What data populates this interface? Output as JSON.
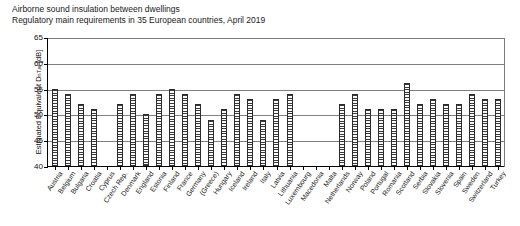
{
  "chart_data": {
    "type": "bar",
    "title": "Airborne sound insulation between dwellings",
    "subtitle": "Regulatory main requirements in 35 European countries, April 2019",
    "xlabel": "",
    "ylabel": "Estimated Equivalent D",
    "ylabel_sub": "nT,w",
    "ylabel_unit": " [dB]",
    "ylim": [
      40,
      65
    ],
    "yticks": [
      40,
      45,
      50,
      55,
      60,
      65
    ],
    "grid": true,
    "legend": "none",
    "categories": [
      "Austria",
      "Belgium",
      "Bulgaria",
      "Croatia",
      "Cyprus",
      "Czech Rep.",
      "Denmark",
      "England",
      "Estonia",
      "Finland",
      "France",
      "Germany",
      "(Greece)",
      "Hungary",
      "Iceland",
      "Ireland",
      "Italy",
      "Latvia",
      "Lithuania",
      "Luxembourg",
      "Macedonia",
      "Malta",
      "Netherlands",
      "Norway",
      "Poland",
      "Portugal",
      "Romania",
      "Scotland",
      "Serbia",
      "Slovakia",
      "Slovenia",
      "Spain",
      "Sweden",
      "Switzerland",
      "Turkey"
    ],
    "values": [
      55,
      54,
      52,
      51,
      null,
      52,
      54,
      50,
      54,
      55,
      54,
      52,
      49,
      51,
      54,
      53,
      49,
      53,
      54,
      null,
      null,
      null,
      52,
      54,
      51,
      51,
      51,
      56,
      52,
      53,
      52,
      52,
      54,
      53,
      53
    ],
    "bar_style": {
      "fill": "#f2f2f2",
      "hatch": "horizontal-stripes",
      "edge": "#2b2b2b"
    }
  }
}
